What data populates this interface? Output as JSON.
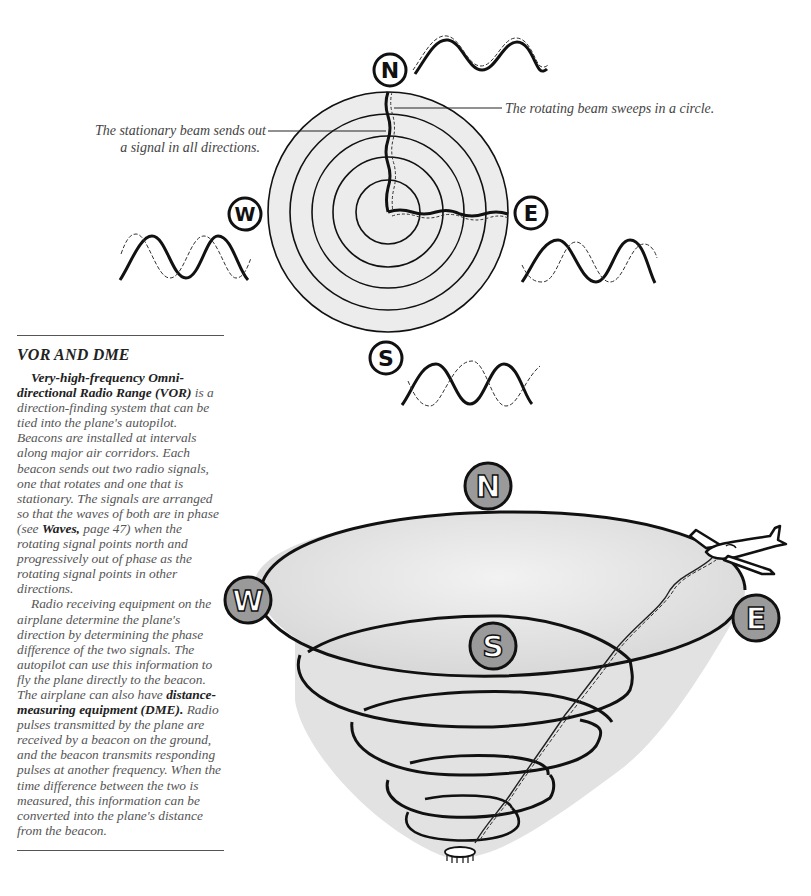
{
  "diagram_top": {
    "compass": {
      "north": "N",
      "south": "S",
      "east": "E",
      "west": "W"
    },
    "callout_rotating": "The rotating beam sweeps in a circle.",
    "callout_stationary_line1": "The stationary beam sends out",
    "callout_stationary_line2": "a signal in all directions.",
    "colors": {
      "disc_fill": "#ececec",
      "ink": "#111111"
    }
  },
  "diagram_bottom": {
    "compass": {
      "north": "N",
      "south": "S",
      "east": "E",
      "west": "W"
    },
    "colors": {
      "badge_fill": "#9a9a9a",
      "cone_fill": "#e6e6e6",
      "ink": "#111111"
    },
    "objects": [
      "airplane-icon",
      "beacon-antenna-icon"
    ]
  },
  "sidebar": {
    "heading": "VOR AND DME",
    "para1": {
      "bold_intro": "Very-high-frequency Omni-directional Radio Range (VOR)",
      "text_a": " is a direction-finding system that can be tied into the plane's autopilot. Beacons are installed at intervals along major air corridors. Each beacon sends out two radio signals, one that rotates and one that is stationary. The signals are arranged so that the waves of both are in phase (see ",
      "bold_ref": "Waves,",
      "text_b": " page 47) when the rotating signal points north and progressively out of phase as the rotating signal points in other directions."
    },
    "para2": {
      "text_a": "Radio receiving equipment on the airplane determine the plane's direction by determining the phase difference of the two signals. The autopilot can use this information to fly the plane directly to the beacon. The airplane can also have ",
      "bold_term": "distance-measuring equipment (DME).",
      "text_b": " Radio pulses transmitted by the plane are received by a beacon on the ground, and the beacon transmits responding pulses at another frequency. When the time difference between the two is measured, this information can be converted into the plane's distance from the beacon."
    }
  }
}
